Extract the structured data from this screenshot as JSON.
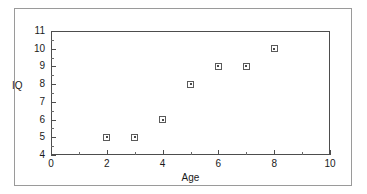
{
  "chart_data": {
    "type": "scatter",
    "title": "",
    "xlabel": "Age",
    "ylabel": "IQ",
    "xlim": [
      0,
      10
    ],
    "ylim": [
      4,
      11
    ],
    "grid": false,
    "legend": null,
    "x_major_ticks": [
      0,
      2,
      4,
      6,
      8,
      10
    ],
    "x_minor_ticks": [
      1,
      3,
      5,
      7,
      9
    ],
    "y_major_ticks": [
      4,
      5,
      6,
      7,
      8,
      9,
      10,
      11
    ],
    "y_minor_ticks": [
      4.5,
      5.5,
      6.5,
      7.5,
      8.5,
      9.5,
      10.5
    ],
    "x_tick_labels": [
      "0",
      "2",
      "4",
      "6",
      "8",
      "10"
    ],
    "y_tick_labels": [
      "4",
      "5",
      "6",
      "7",
      "8",
      "9",
      "10",
      "11"
    ],
    "marker": "square-with-center-dot",
    "points": [
      {
        "x": 2,
        "y": 5
      },
      {
        "x": 3,
        "y": 5
      },
      {
        "x": 4,
        "y": 6
      },
      {
        "x": 5,
        "y": 8
      },
      {
        "x": 6,
        "y": 9
      },
      {
        "x": 7,
        "y": 9
      },
      {
        "x": 8,
        "y": 10
      }
    ]
  },
  "colors": {
    "plot_background": "#ffffff",
    "figure_background": "#ffffff",
    "axis_line": "#4d4d4d",
    "outer_frame": "#9a9a9a",
    "marker_edge": "#5a5a5a",
    "marker_face": "#ffffff",
    "marker_center": "#4a4a4a",
    "text": "#1a1a1a"
  }
}
